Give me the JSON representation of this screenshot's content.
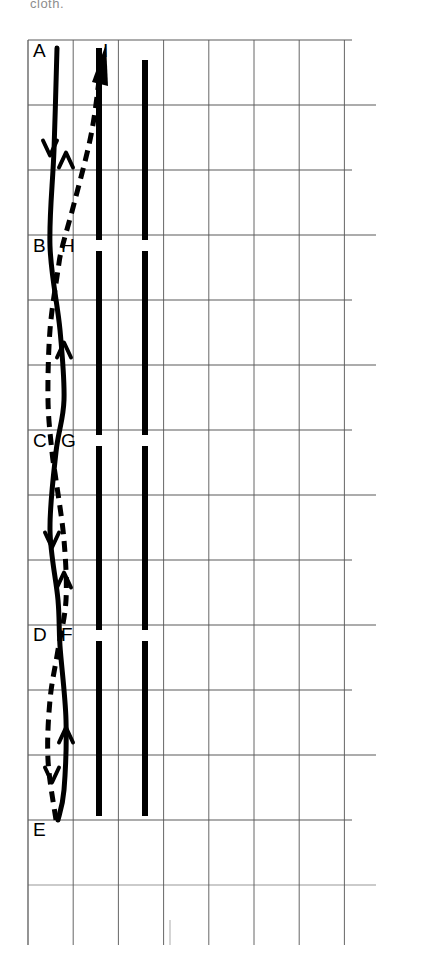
{
  "figure": {
    "type": "path-crossing-grid-diagram",
    "partial_caption_top": "cloth.",
    "background": "#ffffff",
    "ink_color": "#000000",
    "grid_color": "#5a5a5a",
    "width": 426,
    "height": 962
  },
  "grid": {
    "x_start": 28,
    "x_step": 45.2,
    "v_count": 8,
    "y_start": 40,
    "y_step": 65.0,
    "h_count": 14,
    "right_edge": 352,
    "bottom_edge": 945,
    "note": "ruled grid, lines fade toward lower rows"
  },
  "labels": [
    {
      "id": "A",
      "text": "A",
      "x": 33,
      "y": 57,
      "anchor": "start"
    },
    {
      "id": "B",
      "text": "B",
      "x": 33,
      "y": 252,
      "anchor": "start"
    },
    {
      "id": "C",
      "text": "C",
      "x": 33,
      "y": 447,
      "anchor": "start"
    },
    {
      "id": "D",
      "text": "D",
      "x": 33,
      "y": 641,
      "anchor": "start"
    },
    {
      "id": "E",
      "text": "E",
      "x": 33,
      "y": 836,
      "anchor": "start"
    },
    {
      "id": "F",
      "text": "F",
      "x": 61,
      "y": 641,
      "anchor": "start"
    },
    {
      "id": "G",
      "text": "G",
      "x": 61,
      "y": 447,
      "anchor": "start"
    },
    {
      "id": "H",
      "text": "H",
      "x": 61,
      "y": 252,
      "anchor": "start"
    },
    {
      "id": "I",
      "text": "I",
      "x": 103,
      "y": 57,
      "anchor": "start"
    }
  ],
  "solid_path": {
    "name": "solid-curve-A-to-E",
    "style": "solid",
    "stroke_width": 5,
    "direction": "downward",
    "sequence": [
      "A",
      "B",
      "C",
      "D",
      "E"
    ],
    "points": [
      {
        "x": 57,
        "y": 48
      },
      {
        "x": 54,
        "y": 150
      },
      {
        "x": 50,
        "y": 246
      },
      {
        "x": 60,
        "y": 330
      },
      {
        "x": 64,
        "y": 400
      },
      {
        "x": 56,
        "y": 452
      },
      {
        "x": 50,
        "y": 530
      },
      {
        "x": 58,
        "y": 600
      },
      {
        "x": 60,
        "y": 646
      },
      {
        "x": 66,
        "y": 720
      },
      {
        "x": 64,
        "y": 790
      },
      {
        "x": 58,
        "y": 820
      }
    ],
    "arrows": [
      {
        "x": 50,
        "y": 148,
        "dir": "down"
      },
      {
        "x": 52,
        "y": 540,
        "dir": "down"
      },
      {
        "x": 52,
        "y": 775,
        "dir": "down"
      }
    ]
  },
  "dashed_path": {
    "name": "dashed-curve-E-to-I",
    "style": "dashed",
    "stroke_width": 5,
    "dash": "11 7",
    "direction": "upward",
    "sequence": [
      "E",
      "D",
      "C",
      "B",
      "H",
      "I"
    ],
    "points": [
      {
        "x": 56,
        "y": 820
      },
      {
        "x": 48,
        "y": 760
      },
      {
        "x": 50,
        "y": 700
      },
      {
        "x": 58,
        "y": 650
      },
      {
        "x": 66,
        "y": 600
      },
      {
        "x": 64,
        "y": 540
      },
      {
        "x": 56,
        "y": 480
      },
      {
        "x": 52,
        "y": 452
      },
      {
        "x": 48,
        "y": 400
      },
      {
        "x": 50,
        "y": 330
      },
      {
        "x": 58,
        "y": 270
      },
      {
        "x": 62,
        "y": 248
      },
      {
        "x": 75,
        "y": 200
      },
      {
        "x": 92,
        "y": 130
      },
      {
        "x": 102,
        "y": 55
      }
    ],
    "arrows": [
      {
        "x": 66,
        "y": 160,
        "dir": "up"
      },
      {
        "x": 64,
        "y": 350,
        "dir": "up"
      },
      {
        "x": 64,
        "y": 580,
        "dir": "up"
      },
      {
        "x": 66,
        "y": 735,
        "dir": "up"
      }
    ]
  },
  "thick_bars": [
    {
      "name": "thick-bar-left",
      "x": 99,
      "y_top": 48,
      "y_bottom": 816,
      "width": 6,
      "gaps": [
        {
          "y": 240,
          "height": 11
        },
        {
          "y": 435,
          "height": 11
        },
        {
          "y": 630,
          "height": 11
        }
      ]
    },
    {
      "name": "thick-bar-right",
      "x": 145,
      "y_top": 60,
      "y_bottom": 816,
      "width": 6,
      "gaps": [
        {
          "y": 240,
          "height": 11
        },
        {
          "y": 435,
          "height": 11
        },
        {
          "y": 630,
          "height": 11
        }
      ]
    }
  ],
  "crossings": [
    {
      "labels": "B/H",
      "y": 246
    },
    {
      "labels": "C/G",
      "y": 450
    },
    {
      "labels": "D/F",
      "y": 645
    }
  ]
}
